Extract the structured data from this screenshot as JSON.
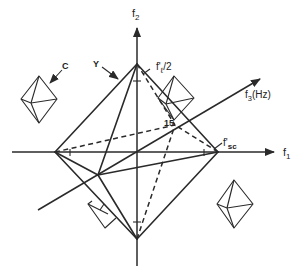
{
  "figure": {
    "axes": {
      "f1": {
        "label": "f",
        "sub": "1"
      },
      "f2": {
        "label": "f",
        "sub": "2"
      },
      "f3": {
        "label": "f",
        "sub": "3",
        "suffix": "(Hz)"
      }
    },
    "annotations": {
      "c_label": "C",
      "y_label": "Y",
      "fl_half": {
        "prefix": "f'",
        "sub": "ℓ",
        "suffix": "/2"
      },
      "fsc": {
        "prefix": "f'",
        "sub": "sc"
      },
      "point_15": "15"
    },
    "colors": {
      "ink": "#2a2a2a",
      "background": "#ffffff"
    }
  }
}
